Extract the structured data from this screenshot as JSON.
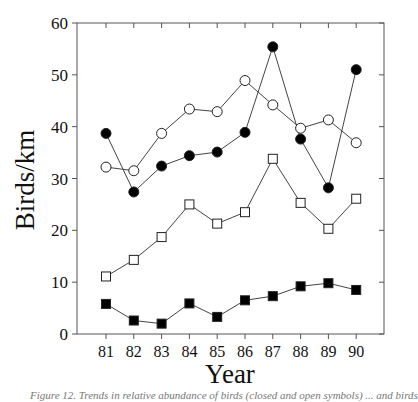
{
  "chart_data": {
    "type": "line",
    "title": "",
    "xlabel": "Year",
    "ylabel": "Birds/km",
    "ylim": [
      0,
      60
    ],
    "yticks": [
      0,
      10,
      20,
      30,
      40,
      50,
      60
    ],
    "grid": false,
    "legend": "none",
    "categories": [
      "81",
      "82",
      "83",
      "84",
      "85",
      "86",
      "87",
      "88",
      "89",
      "90"
    ],
    "series": [
      {
        "name": "filled-circle",
        "marker": "circle",
        "fill": "#000000",
        "values": [
          38.7,
          27.4,
          32.4,
          34.4,
          35.1,
          38.9,
          55.4,
          37.6,
          28.2,
          51.0
        ]
      },
      {
        "name": "open-circle",
        "marker": "circle",
        "fill": "#ffffff",
        "values": [
          32.2,
          31.5,
          38.7,
          43.4,
          42.9,
          48.9,
          44.2,
          39.7,
          41.3,
          36.9
        ]
      },
      {
        "name": "open-square",
        "marker": "square",
        "fill": "#ffffff",
        "values": [
          11.1,
          14.3,
          18.7,
          25.0,
          21.3,
          23.5,
          33.8,
          25.3,
          20.3,
          26.1
        ]
      },
      {
        "name": "filled-square",
        "marker": "square",
        "fill": "#000000",
        "values": [
          5.8,
          2.6,
          2.0,
          5.9,
          3.3,
          6.5,
          7.3,
          9.2,
          9.8,
          8.5
        ]
      }
    ]
  },
  "caption": "Figure 12. Trends in relative abundance of birds (closed and open symbols) ... and birds"
}
